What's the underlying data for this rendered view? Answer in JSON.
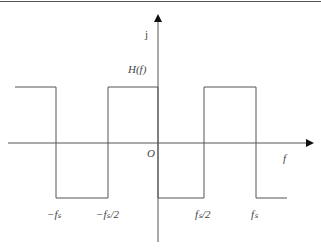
{
  "diagram": {
    "title_label": "H(f)",
    "y_axis_label": "j",
    "x_axis_label": "f",
    "origin_label": "O",
    "ticks": {
      "neg_fs": "−fₛ",
      "neg_fs_half": "−fₛ/2",
      "pos_fs_half": "fₛ/2",
      "pos_fs": "fₛ"
    },
    "line_color": "#555555"
  }
}
